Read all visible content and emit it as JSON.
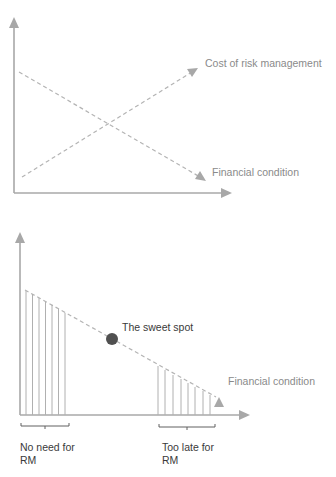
{
  "top_chart": {
    "series": [
      {
        "name": "Cost of risk management",
        "trend": "increasing"
      },
      {
        "name": "Financial condition",
        "trend": "decreasing"
      }
    ],
    "labels": {
      "cost": "Cost of risk management",
      "financial": "Financial condition"
    }
  },
  "bottom_chart": {
    "labels": {
      "sweet_spot": "The sweet spot",
      "financial": "Financial condition",
      "no_need_line1": "No need for",
      "no_need_line2": "RM",
      "too_late_line1": "Too late for",
      "too_late_line2": "RM"
    }
  },
  "colors": {
    "axis": "#a8a8a8",
    "dashed": "#b4b4b4",
    "dot": "#505050",
    "label": "#8a8a8a",
    "label_dark": "#3a3a3a"
  }
}
